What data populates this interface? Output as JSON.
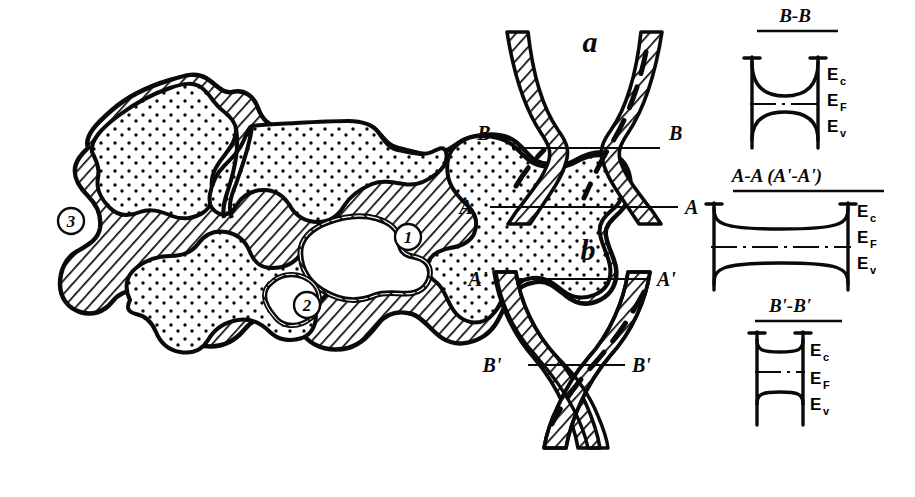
{
  "figure": {
    "kind": "scientific-line-drawing",
    "background_color": "#ffffff",
    "ink_color": "#0a0a0a",
    "description_domain": "semiconductor polycrystalline grain structure and energy band diagrams"
  },
  "left_panel": {
    "name": "polycrystal-grain-map",
    "callouts": [
      {
        "id": "callout-1",
        "label": "1",
        "x": 408,
        "y": 237
      },
      {
        "id": "callout-2",
        "label": "2",
        "x": 307,
        "y": 305
      },
      {
        "id": "callout-3",
        "label": "3",
        "x": 71,
        "y": 221
      }
    ]
  },
  "middle_panel": {
    "name": "grain-boundary-cross-sections",
    "diagrams": [
      {
        "id": "diagram-a",
        "label": "a",
        "label_x": 590,
        "label_y": 52,
        "section_lines": [
          {
            "id": "section-b-b",
            "label_left": "B",
            "label_right": "B",
            "y": 148,
            "x1": 512,
            "x2": 660,
            "label_left_x": 484,
            "label_right_x": 669
          },
          {
            "id": "section-a-a",
            "label_left": "A",
            "label_right": "A",
            "y": 207,
            "x1": 490,
            "x2": 678,
            "label_left_x": 466,
            "label_right_x": 685
          }
        ]
      },
      {
        "id": "diagram-b",
        "label": "b",
        "label_x": 588,
        "label_y": 260,
        "section_lines": [
          {
            "id": "section-a-prime-a-prime",
            "label_left": "A'",
            "label_right": "A'",
            "y": 279,
            "x1": 515,
            "x2": 650,
            "label_left_x": 478,
            "label_right_x": 657
          },
          {
            "id": "section-b-prime-b-prime",
            "label_left": "B'",
            "label_right": "B'",
            "y": 365,
            "x1": 528,
            "x2": 625,
            "label_left_x": 492,
            "label_right_x": 632
          }
        ]
      }
    ]
  },
  "right_panel": {
    "name": "energy-band-diagrams",
    "energy_levels": {
      "conduction": {
        "symbol": "E",
        "subscript": "c",
        "name": "E_c"
      },
      "fermi": {
        "symbol": "E",
        "subscript": "F",
        "name": "E_F"
      },
      "valence": {
        "symbol": "E",
        "subscript": "v",
        "name": "E_v"
      }
    },
    "diagrams": [
      {
        "id": "band-diagram-bb",
        "title": "B-B",
        "title_x": 795,
        "title_y": 22,
        "underline_x1": 757,
        "underline_x2": 838,
        "underline_y": 32,
        "barrier": "large",
        "labels": [
          {
            "id": "ec-label-bb",
            "symbol": "E",
            "subscript": "c",
            "x": 827,
            "y": 80
          },
          {
            "id": "ef-label-bb",
            "symbol": "E",
            "subscript": "F",
            "x": 827,
            "y": 106
          },
          {
            "id": "ev-label-bb",
            "symbol": "E",
            "subscript": "v",
            "x": 827,
            "y": 130
          }
        ]
      },
      {
        "id": "band-diagram-aa",
        "title": "A-A (A'-A')",
        "title_x": 777,
        "title_y": 182,
        "underline_x1": 735,
        "underline_x2": 884,
        "underline_y": 192,
        "barrier": "small",
        "labels": [
          {
            "id": "ec-label-aa",
            "symbol": "E",
            "subscript": "c",
            "x": 857,
            "y": 215
          },
          {
            "id": "ef-label-aa",
            "symbol": "E",
            "subscript": "F",
            "x": 857,
            "y": 240
          },
          {
            "id": "ev-label-aa",
            "symbol": "E",
            "subscript": "v",
            "x": 857,
            "y": 265
          }
        ]
      },
      {
        "id": "band-diagram-bpbp",
        "title": "B'-B'",
        "title_x": 790,
        "title_y": 312,
        "underline_x1": 757,
        "underline_x2": 842,
        "underline_y": 322,
        "barrier": "tiny",
        "labels": [
          {
            "id": "ec-label-bpbp",
            "symbol": "E",
            "subscript": "c",
            "x": 808,
            "y": 355
          },
          {
            "id": "ef-label-bpbp",
            "symbol": "E",
            "subscript": "F",
            "x": 808,
            "y": 382
          },
          {
            "id": "ev-label-bpbp",
            "symbol": "E",
            "subscript": "v",
            "x": 808,
            "y": 407
          }
        ]
      }
    ]
  }
}
